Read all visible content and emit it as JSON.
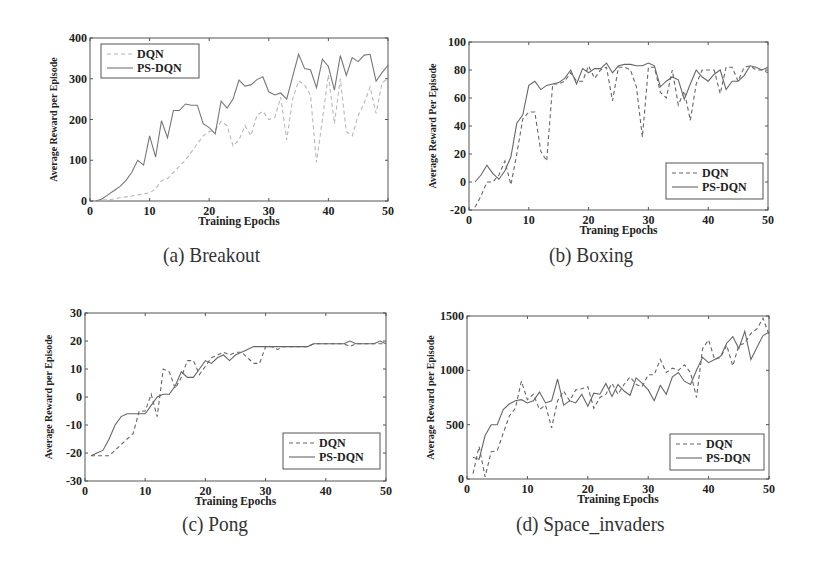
{
  "chart_data": [
    {
      "id": "a",
      "type": "line",
      "caption": "(a) Breakout",
      "title": "",
      "xlabel": "Training Epochs",
      "ylabel": "Average Reward per Episode",
      "xlim": [
        0,
        50
      ],
      "ylim": [
        0,
        400
      ],
      "xticks": [
        0,
        10,
        20,
        30,
        40,
        50
      ],
      "yticks": [
        0,
        100,
        200,
        300,
        400
      ],
      "grid": false,
      "legend_position": "upper left",
      "box": {
        "x0": 90,
        "y0": 38,
        "x1": 388,
        "y1": 201
      },
      "legend": {
        "x": 101,
        "y": 44,
        "w": 98,
        "h": 34
      },
      "x": [
        1,
        2,
        3,
        4,
        5,
        6,
        7,
        8,
        9,
        10,
        11,
        12,
        13,
        14,
        15,
        16,
        17,
        18,
        19,
        20,
        21,
        22,
        23,
        24,
        25,
        26,
        27,
        28,
        29,
        30,
        31,
        32,
        33,
        34,
        35,
        36,
        37,
        38,
        39,
        40,
        41,
        42,
        43,
        44,
        45,
        46,
        47,
        48,
        49,
        50
      ],
      "series": [
        {
          "name": "DQN",
          "style": "dashed",
          "color": "#b8b8b8",
          "values": [
            0,
            2,
            3,
            5,
            8,
            10,
            12,
            15,
            18,
            20,
            30,
            50,
            55,
            70,
            85,
            100,
            120,
            140,
            160,
            170,
            175,
            195,
            185,
            135,
            150,
            185,
            160,
            210,
            220,
            200,
            205,
            255,
            150,
            250,
            295,
            285,
            260,
            95,
            200,
            310,
            190,
            300,
            170,
            160,
            210,
            240,
            280,
            215,
            290,
            300
          ]
        },
        {
          "name": "PS-DQN",
          "style": "solid",
          "color": "#777777",
          "values": [
            0,
            5,
            15,
            25,
            35,
            50,
            70,
            100,
            88,
            160,
            108,
            197,
            155,
            222,
            222,
            238,
            235,
            235,
            190,
            180,
            165,
            245,
            228,
            250,
            297,
            282,
            285,
            298,
            305,
            268,
            260,
            265,
            250,
            305,
            360,
            325,
            322,
            278,
            348,
            330,
            272,
            357,
            308,
            352,
            342,
            358,
            360,
            294,
            315,
            333
          ]
        }
      ]
    },
    {
      "id": "b",
      "type": "line",
      "caption": "(b) Boxing",
      "title": "",
      "xlabel": "Traning Epochs",
      "ylabel": "Average Reward Per Episode",
      "xlim": [
        0,
        50
      ],
      "ylim": [
        -20,
        100
      ],
      "xticks": [
        0,
        10,
        20,
        30,
        40,
        50
      ],
      "yticks": [
        -20,
        0,
        20,
        40,
        60,
        80,
        100
      ],
      "grid": false,
      "legend_position": "lower right",
      "box": {
        "x0": 469,
        "y0": 42,
        "x1": 768,
        "y1": 210
      },
      "legend": {
        "x": 666,
        "y": 163,
        "w": 97,
        "h": 36
      },
      "x": [
        1,
        2,
        3,
        4,
        5,
        6,
        7,
        8,
        9,
        10,
        11,
        12,
        13,
        14,
        15,
        16,
        17,
        18,
        19,
        20,
        21,
        22,
        23,
        24,
        25,
        26,
        27,
        28,
        29,
        30,
        31,
        32,
        33,
        34,
        35,
        36,
        37,
        38,
        39,
        40,
        41,
        42,
        43,
        44,
        45,
        46,
        47,
        48,
        49,
        50
      ],
      "series": [
        {
          "name": "DQN",
          "style": "dashed",
          "color": "#666666",
          "values": [
            -18,
            -10,
            0,
            0,
            5,
            15,
            -2,
            20,
            45,
            50,
            50,
            22,
            15,
            70,
            70,
            72,
            78,
            72,
            72,
            83,
            74,
            80,
            82,
            58,
            82,
            82,
            80,
            68,
            32,
            82,
            82,
            64,
            60,
            80,
            55,
            65,
            44,
            70,
            80,
            80,
            80,
            63,
            82,
            82,
            72,
            82,
            83,
            80,
            80,
            78
          ]
        },
        {
          "name": "PS-DQN",
          "style": "solid",
          "color": "#666666",
          "values": [
            0,
            5,
            12,
            6,
            2,
            8,
            18,
            42,
            48,
            69,
            72,
            66,
            69,
            70,
            71,
            74,
            80,
            70,
            81,
            78,
            81,
            81,
            85,
            78,
            83,
            84,
            84,
            83,
            83,
            85,
            83,
            68,
            72,
            75,
            73,
            59,
            70,
            80,
            75,
            72,
            77,
            80,
            66,
            72,
            72,
            76,
            83,
            82,
            80,
            82
          ]
        }
      ]
    },
    {
      "id": "c",
      "type": "line",
      "caption": "(c) Pong",
      "title": "",
      "xlabel": "Training Epochs",
      "ylabel": "Average Reward per Episode",
      "xlim": [
        0,
        50
      ],
      "ylim": [
        -30,
        30
      ],
      "xticks": [
        0,
        10,
        20,
        30,
        40,
        50
      ],
      "yticks": [
        -30,
        -20,
        -10,
        0,
        10,
        20,
        30
      ],
      "grid": false,
      "legend_position": "lower right",
      "box": {
        "x0": 85,
        "y0": 313,
        "x1": 386,
        "y1": 481
      },
      "legend": {
        "x": 283,
        "y": 433,
        "w": 97,
        "h": 36
      },
      "x": [
        1,
        2,
        3,
        4,
        5,
        6,
        7,
        8,
        9,
        10,
        11,
        12,
        13,
        14,
        15,
        16,
        17,
        18,
        19,
        20,
        21,
        22,
        23,
        24,
        25,
        26,
        27,
        28,
        29,
        30,
        31,
        32,
        33,
        34,
        35,
        36,
        37,
        38,
        39,
        40,
        41,
        42,
        43,
        44,
        45,
        46,
        47,
        48,
        49,
        50
      ],
      "series": [
        {
          "name": "DQN",
          "style": "dashed",
          "color": "#666666",
          "values": [
            -21,
            -21,
            -21,
            -21,
            -19,
            -17,
            -15,
            -13,
            -5,
            -5,
            1,
            -7,
            10,
            9,
            3,
            7,
            13,
            13,
            8,
            11,
            14,
            15,
            16,
            15,
            16,
            16,
            14,
            12,
            12,
            18,
            18,
            17,
            18,
            18,
            18,
            18,
            18,
            19,
            19,
            19,
            19,
            19,
            19,
            18,
            19,
            19,
            19,
            19,
            19,
            19
          ]
        },
        {
          "name": "PS-DQN",
          "style": "solid",
          "color": "#666666",
          "values": [
            -21,
            -20,
            -19,
            -15,
            -10,
            -7,
            -6,
            -6,
            -6,
            -6,
            -3,
            0,
            1,
            1,
            4,
            9,
            7,
            7,
            10,
            13,
            12,
            14,
            15,
            13,
            15,
            16,
            17,
            18,
            18,
            18,
            18,
            18,
            18,
            18,
            18,
            18,
            18,
            19,
            19,
            19,
            19,
            19,
            19,
            20,
            19,
            19,
            19,
            19,
            20,
            19
          ]
        }
      ]
    },
    {
      "id": "d",
      "type": "line",
      "caption": "(d) Space_invaders",
      "title": "",
      "xlabel": "Training Epochs",
      "ylabel": "Average Reward per Episode",
      "xlim": [
        0,
        50
      ],
      "ylim": [
        0,
        1500
      ],
      "xticks": [
        0,
        10,
        20,
        30,
        40,
        50
      ],
      "yticks": [
        0,
        500,
        1000,
        1500
      ],
      "grid": false,
      "legend_position": "lower right",
      "box": {
        "x0": 467,
        "y0": 316,
        "x1": 769,
        "y1": 479
      },
      "legend": {
        "x": 670,
        "y": 434,
        "w": 94,
        "h": 36
      },
      "x": [
        1,
        2,
        3,
        4,
        5,
        6,
        7,
        8,
        9,
        10,
        11,
        12,
        13,
        14,
        15,
        16,
        17,
        18,
        19,
        20,
        21,
        22,
        23,
        24,
        25,
        26,
        27,
        28,
        29,
        30,
        31,
        32,
        33,
        34,
        35,
        36,
        37,
        38,
        39,
        40,
        41,
        42,
        43,
        44,
        45,
        46,
        47,
        48,
        49,
        50
      ],
      "series": [
        {
          "name": "DQN",
          "style": "dashed",
          "color": "#666666",
          "values": [
            50,
            300,
            20,
            250,
            260,
            420,
            580,
            650,
            900,
            730,
            780,
            640,
            680,
            470,
            720,
            810,
            720,
            820,
            830,
            850,
            650,
            750,
            780,
            880,
            780,
            870,
            940,
            870,
            850,
            960,
            960,
            1100,
            980,
            1020,
            1000,
            1050,
            980,
            750,
            1200,
            1280,
            1100,
            1120,
            1230,
            1040,
            1230,
            1250,
            1340,
            1380,
            1480,
            1330
          ]
        },
        {
          "name": "PS-DQN",
          "style": "solid",
          "color": "#666666",
          "values": [
            200,
            180,
            400,
            500,
            500,
            640,
            690,
            720,
            730,
            700,
            720,
            800,
            700,
            720,
            920,
            680,
            720,
            700,
            780,
            670,
            790,
            780,
            880,
            760,
            870,
            810,
            770,
            930,
            880,
            820,
            720,
            860,
            780,
            940,
            980,
            900,
            870,
            1000,
            1120,
            1070,
            1100,
            1130,
            1250,
            1310,
            1200,
            1360,
            1100,
            1210,
            1320,
            1350
          ]
        }
      ]
    }
  ]
}
